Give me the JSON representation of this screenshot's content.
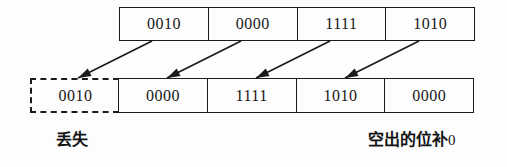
{
  "diagram": {
    "colors": {
      "ink": "#1b1b1b",
      "background": "#fdfdfd",
      "text": "#171717"
    },
    "top_row": {
      "name": "original-bits",
      "cells": [
        "0010",
        "0000",
        "1111",
        "1010"
      ]
    },
    "bottom_row": {
      "name": "shifted-bits",
      "lost_cell": "0010",
      "cells": [
        "0000",
        "1111",
        "1010",
        "0000"
      ]
    },
    "arrows": [
      {
        "name": "shift-arrow-1",
        "from_x": 152,
        "from_y": 41,
        "to_x": 78,
        "to_y": 78
      },
      {
        "name": "shift-arrow-2",
        "from_x": 241,
        "from_y": 41,
        "to_x": 167,
        "to_y": 78
      },
      {
        "name": "shift-arrow-3",
        "from_x": 330,
        "from_y": 41,
        "to_x": 256,
        "to_y": 78
      },
      {
        "name": "shift-arrow-4",
        "from_x": 419,
        "from_y": 41,
        "to_x": 345,
        "to_y": 78
      }
    ],
    "captions": {
      "lost": "丢失",
      "fill_prefix": "空出的位补",
      "fill_zero": "0"
    }
  }
}
